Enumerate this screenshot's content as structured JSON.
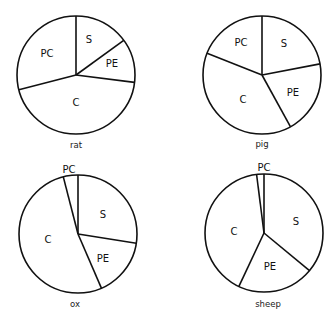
{
  "chart_data": [
    {
      "type": "pie",
      "title": "rat",
      "center": [
        76,
        75
      ],
      "radius": 59,
      "start_angle": "12 o'clock, clockwise",
      "slices": [
        {
          "label": "S",
          "value": 15,
          "label_pos": [
            89,
            43
          ]
        },
        {
          "label": "PE",
          "value": 12,
          "label_pos": [
            112,
            67
          ]
        },
        {
          "label": "C",
          "value": 44,
          "label_pos": [
            76,
            106
          ]
        },
        {
          "label": "PC",
          "value": 29,
          "label_pos": [
            47,
            57
          ]
        }
      ],
      "caption_pos": [
        76,
        148
      ]
    },
    {
      "type": "pie",
      "title": "pig",
      "center": [
        262,
        75
      ],
      "radius": 59,
      "start_angle": "12 o'clock, clockwise",
      "slices": [
        {
          "label": "S",
          "value": 22,
          "label_pos": [
            284,
            47
          ]
        },
        {
          "label": "PE",
          "value": 20,
          "label_pos": [
            293,
            96
          ]
        },
        {
          "label": "C",
          "value": 39,
          "label_pos": [
            243,
            103
          ]
        },
        {
          "label": "PC",
          "value": 19,
          "label_pos": [
            241,
            46
          ]
        }
      ],
      "caption_pos": [
        262,
        147
      ]
    },
    {
      "type": "pie",
      "title": "ox",
      "center": [
        78,
        234
      ],
      "radius": 59,
      "start_angle": "12 o'clock, clockwise",
      "slices": [
        {
          "label": "S",
          "value": 27.5,
          "label_pos": [
            103,
            218
          ]
        },
        {
          "label": "PE",
          "value": 16,
          "label_pos": [
            103,
            262
          ]
        },
        {
          "label": "C",
          "value": 52.5,
          "label_pos": [
            48,
            243
          ]
        },
        {
          "label": "PC",
          "value": 4,
          "label_pos": [
            69,
            173
          ]
        }
      ],
      "caption_pos": [
        75,
        307
      ]
    },
    {
      "type": "pie",
      "title": "sheep",
      "center": [
        264,
        233
      ],
      "radius": 59,
      "start_angle": "12 o'clock, clockwise",
      "slices": [
        {
          "label": "S",
          "value": 36,
          "label_pos": [
            296,
            225
          ]
        },
        {
          "label": "PE",
          "value": 21,
          "label_pos": [
            270,
            270
          ]
        },
        {
          "label": "C",
          "value": 41,
          "label_pos": [
            234,
            235
          ]
        },
        {
          "label": "PC",
          "value": 2,
          "label_pos": [
            264,
            171
          ]
        }
      ],
      "caption_pos": [
        268,
        307
      ]
    }
  ],
  "style": {
    "stroke": "#111111",
    "fill": "#ffffff",
    "stroke_width": 1.6
  }
}
